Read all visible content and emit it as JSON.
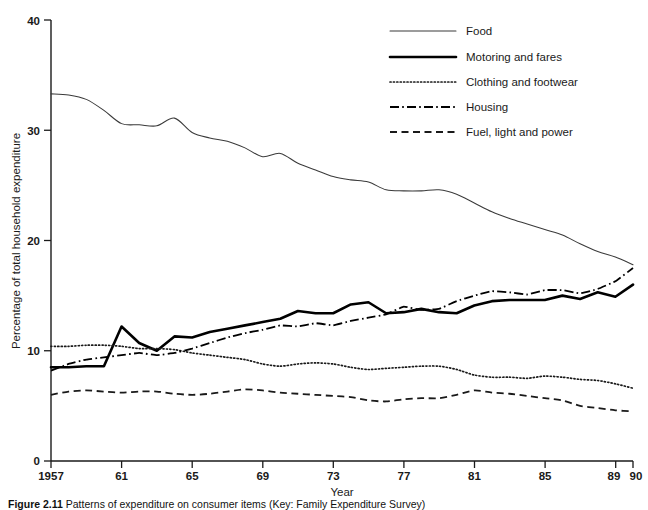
{
  "chart_data": {
    "type": "line",
    "title": "",
    "xlabel": "Year",
    "ylabel": "Percentage of total household expenditure",
    "xlim": [
      1957,
      1990
    ],
    "ylim": [
      0,
      40
    ],
    "grid": false,
    "legend_position": "top-right",
    "x_tick_labels": [
      "1957",
      "61",
      "65",
      "69",
      "73",
      "77",
      "81",
      "85",
      "89",
      "90"
    ],
    "x_tick_values": [
      1957,
      1961,
      1965,
      1969,
      1973,
      1977,
      1981,
      1985,
      1989,
      1990
    ],
    "y_tick_labels": [
      "0",
      "10",
      "20",
      "30",
      "40"
    ],
    "y_tick_values": [
      0,
      10,
      20,
      30,
      40
    ],
    "x": [
      1957,
      1958,
      1959,
      1960,
      1961,
      1962,
      1963,
      1964,
      1965,
      1966,
      1967,
      1968,
      1969,
      1970,
      1971,
      1972,
      1973,
      1974,
      1975,
      1976,
      1977,
      1978,
      1979,
      1980,
      1981,
      1982,
      1983,
      1984,
      1985,
      1986,
      1987,
      1988,
      1989,
      1990
    ],
    "series": [
      {
        "name": "Food",
        "style": "solid-thin",
        "values": [
          33.3,
          33.2,
          32.8,
          31.8,
          30.6,
          30.5,
          30.4,
          31.1,
          29.8,
          29.3,
          29.0,
          28.4,
          27.6,
          27.9,
          27.0,
          26.4,
          25.8,
          25.5,
          25.3,
          24.6,
          24.5,
          24.5,
          24.6,
          24.2,
          23.4,
          22.6,
          22.0,
          21.5,
          21.0,
          20.5,
          19.7,
          19.0,
          18.5,
          17.8
        ]
      },
      {
        "name": "Motoring and fares",
        "style": "solid-thick",
        "values": [
          8.5,
          8.5,
          8.6,
          8.6,
          12.2,
          10.7,
          10.0,
          11.3,
          11.2,
          11.7,
          12.0,
          12.3,
          12.6,
          12.9,
          13.6,
          13.4,
          13.4,
          14.2,
          14.4,
          13.4,
          13.5,
          13.8,
          13.5,
          13.4,
          14.1,
          14.5,
          14.6,
          14.6,
          14.6,
          15.0,
          14.7,
          15.3,
          14.9,
          16.0
        ]
      },
      {
        "name": "Clothing and footwear",
        "style": "dotted",
        "values": [
          10.4,
          10.4,
          10.5,
          10.5,
          10.4,
          10.2,
          10.2,
          10.1,
          9.8,
          9.6,
          9.4,
          9.2,
          8.8,
          8.6,
          8.8,
          8.9,
          8.8,
          8.5,
          8.3,
          8.4,
          8.5,
          8.6,
          8.6,
          8.3,
          7.8,
          7.6,
          7.6,
          7.5,
          7.7,
          7.6,
          7.4,
          7.3,
          7.0,
          6.6
        ]
      },
      {
        "name": "Housing",
        "style": "dash-dot",
        "values": [
          8.2,
          8.8,
          9.2,
          9.4,
          9.6,
          9.8,
          9.6,
          9.8,
          10.2,
          10.7,
          11.2,
          11.6,
          11.9,
          12.3,
          12.2,
          12.5,
          12.3,
          12.7,
          13.0,
          13.3,
          14.0,
          13.7,
          13.8,
          14.5,
          15.0,
          15.4,
          15.3,
          15.1,
          15.5,
          15.5,
          15.2,
          15.6,
          16.3,
          17.5
        ]
      },
      {
        "name": "Fuel, light and power",
        "style": "dashed",
        "values": [
          6.0,
          6.3,
          6.4,
          6.3,
          6.2,
          6.3,
          6.3,
          6.1,
          6.0,
          6.1,
          6.3,
          6.5,
          6.4,
          6.2,
          6.1,
          6.0,
          5.9,
          5.8,
          5.5,
          5.4,
          5.6,
          5.7,
          5.7,
          6.0,
          6.4,
          6.2,
          6.1,
          5.9,
          5.7,
          5.5,
          5.0,
          4.8,
          4.6,
          4.5
        ]
      }
    ]
  },
  "legend": {
    "entries": [
      {
        "label": "Food",
        "icon": "line-solid-thin-icon"
      },
      {
        "label": "Motoring and fares",
        "icon": "line-solid-thick-icon"
      },
      {
        "label": "Clothing and footwear",
        "icon": "line-dotted-icon"
      },
      {
        "label": "Housing",
        "icon": "line-dash-dot-icon"
      },
      {
        "label": "Fuel, light and power",
        "icon": "line-dashed-icon"
      }
    ]
  },
  "caption": {
    "number": "Figure 2.11",
    "body": "Patterns of expenditure on consumer items (Key: Family Expenditure Survey)"
  }
}
